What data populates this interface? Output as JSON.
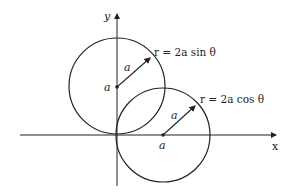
{
  "diagram": {
    "axes": {
      "x_label": "x",
      "y_label": "y"
    },
    "circles": [
      {
        "name": "upper-circle",
        "equation": "r = 2a sin θ",
        "center_label": "a",
        "radius_label": "a",
        "cx": 117,
        "cy": 87,
        "r": 47
      },
      {
        "name": "right-circle",
        "equation": "r = 2a cos θ",
        "center_label": "a",
        "radius_label": "a",
        "cx": 163,
        "cy": 135,
        "r": 47
      }
    ],
    "stroke_color": "#222222"
  }
}
